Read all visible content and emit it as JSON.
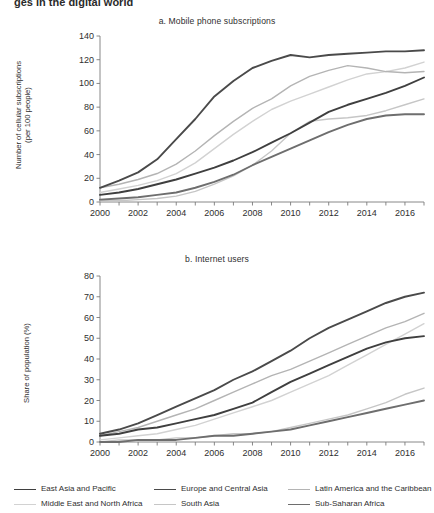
{
  "document": {
    "clipped_heading": "ges in the digital world"
  },
  "legend": {
    "position": "bottom",
    "entries": [
      {
        "label": "East Asia and Pacific",
        "color": "#3f3f3f",
        "width": 1.9
      },
      {
        "label": "Europe and Central Asia",
        "color": "#4a4a4a",
        "width": 1.9
      },
      {
        "label": "Latin America and the Caribbean",
        "color": "#b4b4b4",
        "width": 1.4
      },
      {
        "label": "Middle East and North Africa",
        "color": "#d2d2d2",
        "width": 1.4
      },
      {
        "label": "South Asia",
        "color": "#c6c6c6",
        "width": 1.4
      },
      {
        "label": "Sub-Saharan Africa",
        "color": "#6e6e6e",
        "width": 1.9
      }
    ]
  },
  "chart_data": [
    {
      "type": "line",
      "id": "panel-a",
      "title": "a. Mobile phone subscriptions",
      "xlabel": "",
      "ylabel": "Number of cellular subscriptions (per 100 people)",
      "ylabel_lines": [
        "Number of cellular subscriptions",
        "(per 100 people)"
      ],
      "x": [
        2000,
        2001,
        2002,
        2003,
        2004,
        2005,
        2006,
        2007,
        2008,
        2009,
        2010,
        2011,
        2012,
        2013,
        2014,
        2015,
        2016,
        2017
      ],
      "xlim": [
        2000,
        2017
      ],
      "ylim": [
        0,
        140
      ],
      "yticks": [
        0,
        20,
        40,
        60,
        80,
        100,
        120,
        140
      ],
      "xticks_labeled": [
        2000,
        2002,
        2004,
        2006,
        2008,
        2010,
        2012,
        2014,
        2016
      ],
      "grid": false,
      "series": [
        {
          "name": "East Asia and Pacific",
          "color": "#3f3f3f",
          "values": [
            6,
            8,
            11,
            15,
            19,
            24,
            29,
            35,
            42,
            50,
            58,
            67,
            76,
            82,
            87,
            92,
            98,
            105
          ]
        },
        {
          "name": "Europe and Central Asia",
          "color": "#4a4a4a",
          "values": [
            12,
            18,
            25,
            36,
            53,
            70,
            89,
            102,
            113,
            119,
            124,
            122,
            124,
            125,
            126,
            127,
            127,
            128
          ]
        },
        {
          "name": "Latin America and the Caribbean",
          "color": "#b4b4b4",
          "values": [
            12,
            15,
            19,
            24,
            32,
            43,
            56,
            68,
            79,
            87,
            98,
            106,
            111,
            115,
            113,
            110,
            109,
            110
          ]
        },
        {
          "name": "Middle East and North Africa",
          "color": "#d2d2d2",
          "values": [
            8,
            11,
            14,
            18,
            24,
            33,
            45,
            57,
            68,
            78,
            85,
            91,
            97,
            103,
            108,
            110,
            113,
            118
          ]
        },
        {
          "name": "South Asia",
          "color": "#c6c6c6",
          "values": [
            1,
            1,
            2,
            3,
            5,
            9,
            15,
            22,
            31,
            43,
            58,
            68,
            70,
            71,
            73,
            77,
            82,
            87
          ]
        },
        {
          "name": "Sub-Saharan Africa",
          "color": "#6e6e6e",
          "values": [
            2,
            3,
            4,
            6,
            8,
            12,
            17,
            23,
            31,
            38,
            45,
            52,
            59,
            65,
            70,
            73,
            74,
            74
          ]
        }
      ]
    },
    {
      "type": "line",
      "id": "panel-b",
      "title": "b. Internet users",
      "xlabel": "",
      "ylabel": "Share of population (%)",
      "ylabel_lines": [
        "Share of population (%)"
      ],
      "x": [
        2000,
        2001,
        2002,
        2003,
        2004,
        2005,
        2006,
        2007,
        2008,
        2009,
        2010,
        2011,
        2012,
        2013,
        2014,
        2015,
        2016,
        2017
      ],
      "xlim": [
        2000,
        2017
      ],
      "ylim": [
        0,
        80
      ],
      "yticks": [
        0,
        10,
        20,
        30,
        40,
        50,
        60,
        70,
        80
      ],
      "xticks_labeled": [
        2000,
        2002,
        2004,
        2006,
        2008,
        2010,
        2012,
        2014,
        2016
      ],
      "grid": false,
      "series": [
        {
          "name": "East Asia and Pacific",
          "color": "#3f3f3f",
          "values": [
            3,
            4,
            6,
            7,
            9,
            11,
            13,
            16,
            19,
            24,
            29,
            33,
            37,
            41,
            45,
            48,
            50,
            51
          ]
        },
        {
          "name": "Europe and Central Asia",
          "color": "#4a4a4a",
          "values": [
            4,
            6,
            9,
            13,
            17,
            21,
            25,
            30,
            34,
            39,
            44,
            50,
            55,
            59,
            63,
            67,
            70,
            72
          ]
        },
        {
          "name": "Latin America and the Caribbean",
          "color": "#b4b4b4",
          "values": [
            3,
            5,
            7,
            10,
            13,
            16,
            20,
            24,
            28,
            32,
            35,
            39,
            43,
            47,
            51,
            55,
            58,
            62
          ]
        },
        {
          "name": "Middle East and North Africa",
          "color": "#d2d2d2",
          "values": [
            1,
            2,
            3,
            4,
            6,
            8,
            11,
            14,
            17,
            20,
            24,
            28,
            32,
            37,
            42,
            47,
            52,
            57
          ]
        },
        {
          "name": "South Asia",
          "color": "#c6c6c6",
          "values": [
            0,
            1,
            1,
            1,
            2,
            2,
            3,
            4,
            4,
            5,
            7,
            9,
            11,
            13,
            16,
            19,
            23,
            26
          ]
        },
        {
          "name": "Sub-Saharan Africa",
          "color": "#6e6e6e",
          "values": [
            0,
            0,
            1,
            1,
            1,
            2,
            3,
            3,
            4,
            5,
            6,
            8,
            10,
            12,
            14,
            16,
            18,
            20
          ]
        }
      ]
    }
  ]
}
